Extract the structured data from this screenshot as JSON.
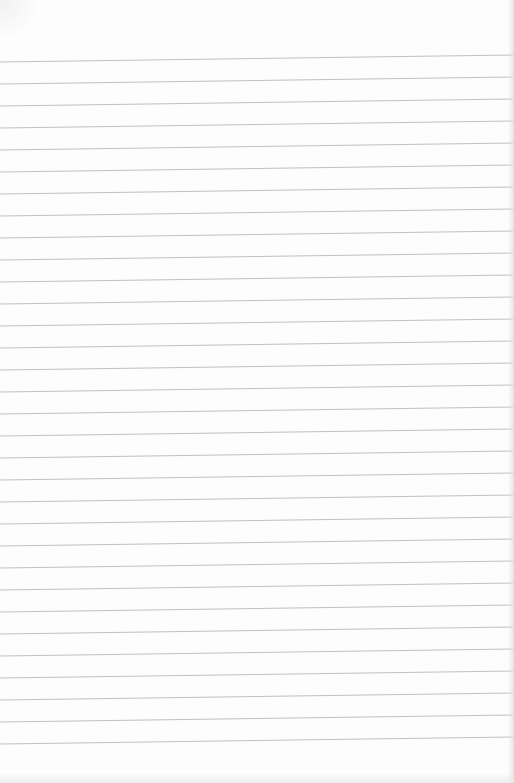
{
  "page": {
    "type": "lined-paper",
    "background_color": "#fdfdfd",
    "line_color": "#b9b9b9",
    "line_count": 32,
    "line_spacing_px": 22,
    "first_line_left_y": 62,
    "first_line_right_y": 55
  }
}
